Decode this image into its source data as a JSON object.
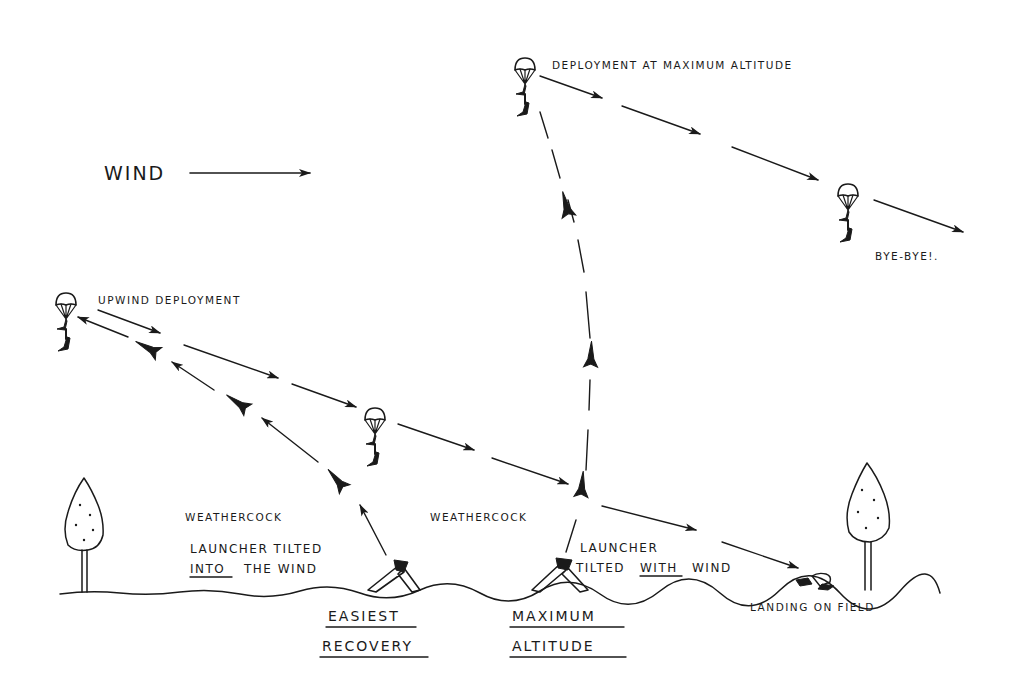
{
  "diagram": {
    "title": "",
    "wind_label": "WIND",
    "labels": {
      "deployment_max_altitude": "DEPLOYMENT AT MAXIMUM ALTITUDE",
      "bye_bye": "BYE-BYE!.",
      "upwind_deployment": "UPWIND DEPLOYMENT",
      "weathercock_left": "WEATHERCOCK",
      "launcher_tilted_left_line1": "LAUNCHER TILTED",
      "launcher_tilted_left_into": "INTO",
      "launcher_tilted_left_line2_rest": "THE WIND",
      "weathercock_right": "WEATHERCOCK",
      "launcher_right_line1": "LAUNCHER",
      "launcher_right_tilted": "TILTED",
      "launcher_right_with": "WITH",
      "launcher_right_wind": "WIND",
      "landing_on_field": "LANDING ON FIELD"
    },
    "captions": {
      "left": {
        "line1": "EASIEST",
        "line2": "RECOVERY"
      },
      "right": {
        "line1": "MAXIMUM",
        "line2": "ALTITUDE"
      }
    },
    "colors": {
      "ink": "#1a1a1a",
      "paper": "#ffffff"
    }
  }
}
